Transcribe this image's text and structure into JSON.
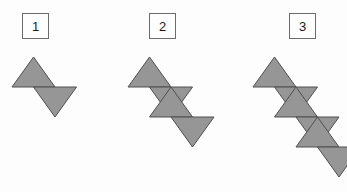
{
  "diagram": {
    "background_color": "#fdfdfd",
    "triangle_fill": "#969696",
    "triangle_stroke": "#4f4f4f",
    "label_border_color": "#6b6b6b",
    "label_text_color": "#1a1a1a",
    "geometry": {
      "triangle_side": 43,
      "triangle_height": 30,
      "step_x": 21.5,
      "step_y": 30,
      "description": "Figure N is a diagonal strip of 2N equilateral triangles alternating point-up and point-down, each successive pair offset down and to the right."
    },
    "figures": [
      {
        "label": "1",
        "triangle_count": 2,
        "label_box": {
          "x": 22,
          "y": 13,
          "width": 27,
          "height": 26
        },
        "origin": {
          "x": 12,
          "y": 57
        }
      },
      {
        "label": "2",
        "triangle_count": 4,
        "label_box": {
          "x": 149,
          "y": 13,
          "width": 27,
          "height": 26
        },
        "origin": {
          "x": 128,
          "y": 57
        }
      },
      {
        "label": "3",
        "triangle_count": 6,
        "label_box": {
          "x": 289,
          "y": 13,
          "width": 27,
          "height": 26
        },
        "origin": {
          "x": 253,
          "y": 57
        }
      }
    ]
  }
}
